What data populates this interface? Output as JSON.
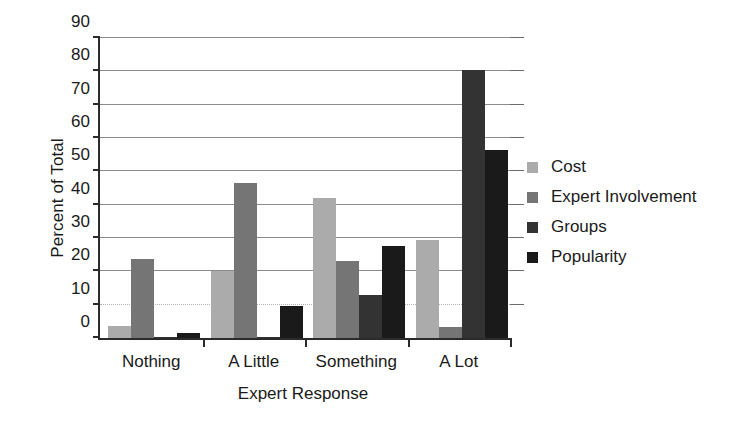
{
  "chart_data": {
    "type": "bar",
    "title": "",
    "xlabel": "Expert Response",
    "ylabel": "Percent of Total",
    "categories": [
      "Nothing",
      "A Little",
      "Something",
      "A Lot"
    ],
    "series": [
      {
        "name": "Cost",
        "color": "#ababab",
        "values": [
          3.5,
          20.0,
          42.0,
          29.5
        ]
      },
      {
        "name": "Expert Involvement",
        "color": "#757575",
        "values": [
          23.8,
          46.5,
          23.0,
          3.3
        ]
      },
      {
        "name": "Groups",
        "color": "#333333",
        "values": [
          0.3,
          0.3,
          13.0,
          80.5
        ]
      },
      {
        "name": "Popularity",
        "color": "#1a1a1a",
        "values": [
          1.5,
          9.5,
          27.5,
          56.5
        ]
      }
    ],
    "ylim": [
      0,
      90
    ],
    "ytick_step": 10,
    "yticks": [
      0,
      10,
      20,
      30,
      40,
      50,
      60,
      70,
      80,
      90
    ],
    "ytick_labels": [
      "0",
      "10",
      "20",
      "30",
      "40",
      "50",
      "60",
      "70",
      "80",
      "90"
    ],
    "grid": true,
    "grid_axis": "y",
    "legend_position": "right",
    "bar_layout": "grouped"
  },
  "axes": {
    "y_title": "Percent of Total",
    "x_title": "Expert Response"
  }
}
